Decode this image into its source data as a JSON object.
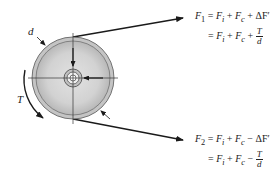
{
  "diagram": {
    "type": "belt-pulley free body diagram",
    "labels": {
      "diameter": "d",
      "torque": "T"
    },
    "equations": {
      "tight_side": {
        "lhs": "F",
        "lhs_sub": "1",
        "line1_terms": "= F_i + F_c + ΔF'",
        "line2_terms": "= F_i + F_c + T/d",
        "line1": {
          "p1": " = ",
          "a": "F",
          "a_sub": "i",
          "p2": " + ",
          "b": "F",
          "b_sub": "c",
          "p3": " + ΔF′"
        },
        "line2": {
          "p1": "= ",
          "a": "F",
          "a_sub": "i",
          "p2": " + ",
          "b": "F",
          "b_sub": "c",
          "p3": " + ",
          "num": "T",
          "den": "d"
        }
      },
      "slack_side": {
        "lhs": "F",
        "lhs_sub": "2",
        "line1": {
          "p1": " = ",
          "a": "F",
          "a_sub": "i",
          "p2": " + ",
          "b": "F",
          "b_sub": "c",
          "p3": " − ΔF′"
        },
        "line2": {
          "p1": "= ",
          "a": "F",
          "a_sub": "i",
          "p2": " + ",
          "b": "F",
          "b_sub": "c",
          "p3": " − ",
          "num": "T",
          "den": "d"
        }
      }
    },
    "colors": {
      "line": "#1a1a1a",
      "pulley_rim": "#c8c8c8",
      "pulley_face": "#d6d6d6",
      "pulley_shadow": "#b0b0b0",
      "hub": "#e8e8e8"
    }
  }
}
